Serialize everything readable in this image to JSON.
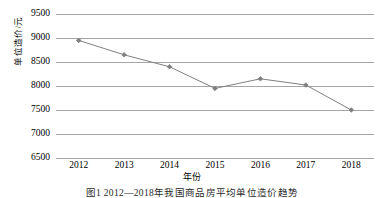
{
  "figure": {
    "caption": "图1  2012—2018年我国商品房平均单位造价趋势"
  },
  "chart_data": {
    "type": "line",
    "title": "",
    "xlabel": "年份",
    "ylabel": "单位造价/元",
    "categories": [
      "2012",
      "2013",
      "2014",
      "2015",
      "2016",
      "2017",
      "2018"
    ],
    "series": [
      {
        "name": "单位造价",
        "values": [
          8950,
          8650,
          8400,
          7950,
          8150,
          8020,
          7500
        ]
      }
    ],
    "ylim": [
      6500,
      9500
    ],
    "yticks": [
      6500,
      7000,
      7500,
      8000,
      8500,
      9000,
      9500
    ],
    "ytick_labels": [
      "6500",
      "7000",
      "7500",
      "8000",
      "8500",
      "9000",
      "9500"
    ],
    "grid": "horizontal",
    "legend": "none",
    "marker": "diamond",
    "line_color": "#808080",
    "marker_color": "#7f7f7f",
    "grid_color": "#a6a6a6",
    "background": "#ffffff"
  }
}
